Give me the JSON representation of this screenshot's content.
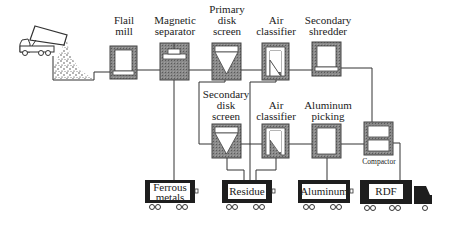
{
  "diagram": {
    "colors": {
      "line": "#333333",
      "unit_fill": "#7a7a7a",
      "unit_border": "#444444",
      "cart_fill": "#1e1e1e",
      "inner": "#ffffff"
    },
    "units": [
      {
        "id": "flail-mill",
        "label": "Flail\nmill",
        "icon": "shredder-icon"
      },
      {
        "id": "magnetic-separator",
        "label": "Magnetic\nseparator",
        "icon": "magnet-icon"
      },
      {
        "id": "primary-disk-screen",
        "label": "Primary\ndisk\nscreen",
        "icon": "funnel-screen-icon"
      },
      {
        "id": "air-classifier-1",
        "label": "Air\nclassifier",
        "icon": "air-classifier-icon"
      },
      {
        "id": "secondary-shredder",
        "label": "Secondary\nshredder",
        "icon": "shredder-icon"
      },
      {
        "id": "secondary-disk-screen",
        "label": "Secondary\ndisk\nscreen",
        "icon": "funnel-screen-icon"
      },
      {
        "id": "air-classifier-2",
        "label": "Air\nclassifier",
        "icon": "air-classifier-icon"
      },
      {
        "id": "aluminum-picking",
        "label": "Aluminum\npicking",
        "icon": "picking-station-icon"
      },
      {
        "id": "compactor",
        "label": "Compactor",
        "icon": "compactor-icon"
      }
    ],
    "outputs": [
      {
        "id": "ferrous-metals",
        "label": "Ferrous\nmetals"
      },
      {
        "id": "residue",
        "label": "Residue"
      },
      {
        "id": "aluminum",
        "label": "Aluminum"
      },
      {
        "id": "rdf",
        "label": "RDF"
      }
    ],
    "source": {
      "label": "Dump truck unloading waste into tipping pit"
    }
  }
}
